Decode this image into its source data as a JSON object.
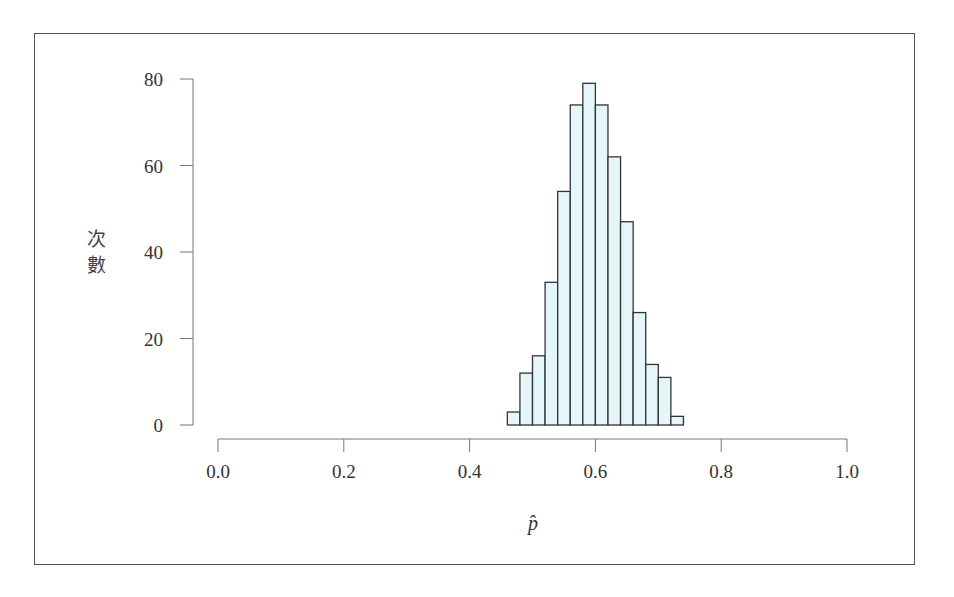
{
  "chart_data": {
    "type": "bar",
    "subtype": "histogram",
    "title": "",
    "xlabel": "p̂",
    "ylabel": "次數",
    "bin_edges": [
      0.46,
      0.48,
      0.5,
      0.52,
      0.54,
      0.56,
      0.58,
      0.6,
      0.62,
      0.64,
      0.66,
      0.68,
      0.7,
      0.72,
      0.74
    ],
    "categories": [
      "0.46-0.48",
      "0.48-0.50",
      "0.50-0.52",
      "0.52-0.54",
      "0.54-0.56",
      "0.56-0.58",
      "0.58-0.60",
      "0.60-0.62",
      "0.62-0.64",
      "0.64-0.66",
      "0.66-0.68",
      "0.68-0.70",
      "0.70-0.72",
      "0.72-0.74"
    ],
    "values": [
      3,
      12,
      16,
      33,
      54,
      74,
      79,
      74,
      62,
      47,
      26,
      14,
      11,
      2
    ],
    "xlim": [
      0.0,
      1.0
    ],
    "ylim": [
      0,
      80
    ],
    "xticks": [
      "0.0",
      "0.2",
      "0.4",
      "0.6",
      "0.8",
      "1.0"
    ],
    "yticks": [
      "0",
      "20",
      "40",
      "60",
      "80"
    ],
    "grid": false,
    "legend": null,
    "bar_fill": "#e4f6fa",
    "bar_edge": "#333333"
  }
}
